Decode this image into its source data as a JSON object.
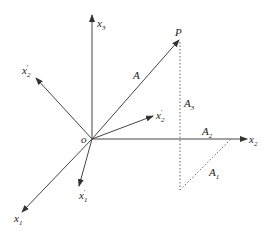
{
  "diagram": {
    "type": "coordinate-rotation-vector",
    "colors": {
      "line": "#444444",
      "text": "#222222",
      "background": "#ffffff"
    },
    "origin": {
      "label": "o"
    },
    "point": {
      "label": "P"
    },
    "vector": {
      "label": "A"
    },
    "axes": [
      {
        "id": "x1",
        "base": "x",
        "sub": "1",
        "prime": ""
      },
      {
        "id": "x2",
        "base": "x",
        "sub": "2",
        "prime": ""
      },
      {
        "id": "x3",
        "base": "x",
        "sub": "3",
        "prime": ""
      },
      {
        "id": "x1p",
        "base": "x",
        "sub": "1",
        "prime": "′"
      },
      {
        "id": "x2p",
        "base": "x",
        "sub": "2",
        "prime": "′"
      },
      {
        "id": "x2p_upper",
        "base": "x",
        "sub": "2",
        "prime": "′"
      }
    ],
    "components": [
      {
        "id": "A1",
        "base": "A",
        "sub": "1"
      },
      {
        "id": "A2",
        "base": "A",
        "sub": "2"
      },
      {
        "id": "A3",
        "base": "A",
        "sub": "3"
      }
    ]
  }
}
